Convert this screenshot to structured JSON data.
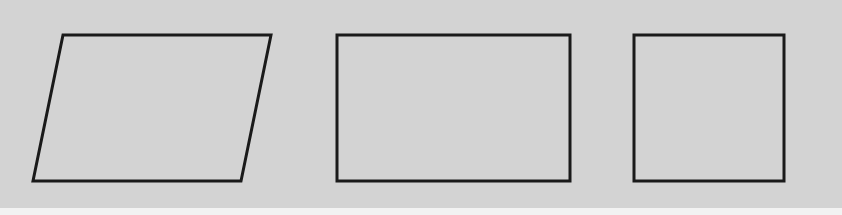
{
  "diagram": {
    "background_color": "#d3d3d3",
    "stroke_color": "#1a1a1a",
    "stroke_width": 3,
    "shapes": [
      {
        "name": "parallelogram",
        "points": "63,35 271,35 241,181 33,181"
      },
      {
        "name": "rectangle",
        "x": 337,
        "y": 35,
        "width": 233,
        "height": 146
      },
      {
        "name": "square",
        "x": 634,
        "y": 35,
        "width": 150,
        "height": 146
      }
    ]
  }
}
